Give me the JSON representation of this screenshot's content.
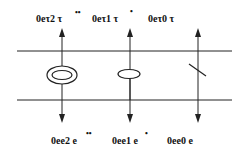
{
  "diagram": {
    "type": "level-transition diagram",
    "colors": {
      "line": "#222222",
      "background": "#ffffff"
    },
    "top_labels": [
      {
        "text": "0eτ2 τ",
        "sup": "••"
      },
      {
        "text": "0eτ1 τ",
        "sup": "•"
      },
      {
        "text": "0eτ0 τ",
        "sup": ""
      }
    ],
    "bottom_labels": [
      {
        "text": "0ee2 e",
        "sup": "••"
      },
      {
        "text": "0ee1 e",
        "sup": "•"
      },
      {
        "text": "0ee0  e",
        "sup": ""
      }
    ],
    "symbols": [
      {
        "name": "double-ellipse",
        "column": 0
      },
      {
        "name": "single-ellipse",
        "column": 1
      },
      {
        "name": "slash",
        "column": 2
      }
    ],
    "arrows": [
      {
        "column": 0,
        "up": true,
        "down": true
      },
      {
        "column": 1,
        "up": true,
        "down": true
      },
      {
        "column": 2,
        "up": true,
        "down": true
      }
    ]
  }
}
